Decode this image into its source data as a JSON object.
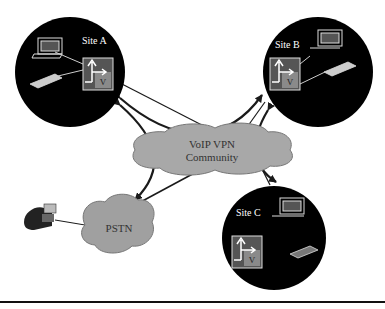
{
  "diagram": {
    "sites": [
      {
        "id": "site-a",
        "label": "Site A",
        "router_label": "V"
      },
      {
        "id": "site-b",
        "label": "Site B",
        "router_label": "V"
      },
      {
        "id": "site-c",
        "label": "Site C",
        "router_label": "V"
      }
    ],
    "clouds": {
      "vpn": {
        "line1": "VoIP VPN",
        "line2": "Community"
      },
      "pstn": {
        "label": "PSTN"
      }
    },
    "colors": {
      "site_fill": "#000000",
      "cloud_fill": "#a8a8a8",
      "router_gray": "#8a8a8a",
      "line": "#1a1a1a"
    }
  }
}
